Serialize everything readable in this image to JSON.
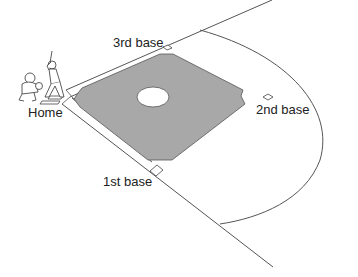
{
  "diagram": {
    "colors": {
      "infield_fill": "#a8a8a8",
      "line": "#555555",
      "background": "#ffffff",
      "mound": "#ffffff"
    },
    "labels": {
      "home": "Home",
      "first_base": "1st base",
      "second_base": "2nd base",
      "third_base": "3rd base"
    },
    "figures": [
      "batter",
      "catcher"
    ]
  }
}
